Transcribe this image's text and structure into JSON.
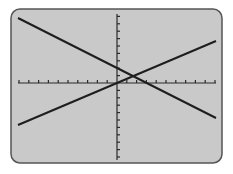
{
  "screen": {
    "background": "#c9c9c9",
    "frame_color": "#555555",
    "line_color": "#1e1e1e",
    "axis_color": "#2a2a2a"
  },
  "chart_data": {
    "type": "line",
    "title": "",
    "xlabel": "",
    "ylabel": "",
    "grid": false,
    "legend": "none",
    "x_tick_count_left": 10,
    "x_tick_count_right": 10,
    "y_tick_count_up": 9,
    "y_tick_count_down": 10,
    "xlim": [
      -10,
      10
    ],
    "ylim": [
      -10,
      10
    ],
    "series": [
      {
        "name": "decreasing line",
        "x": [
          -10,
          10
        ],
        "y": [
          9,
          -5
        ]
      },
      {
        "name": "increasing line",
        "x": [
          -10,
          10
        ],
        "y": [
          -6,
          6
        ]
      }
    ],
    "intersection": {
      "x": 1.5,
      "y": 0.9
    }
  }
}
